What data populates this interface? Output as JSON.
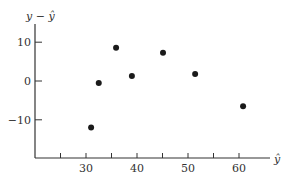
{
  "chart_data": {
    "type": "scatter",
    "title": "",
    "xlabel": "ŷ",
    "ylabel": "y − ŷ",
    "xlim": [
      20,
      66
    ],
    "ylim": [
      -20,
      14
    ],
    "x_ticks": [
      25,
      30,
      35,
      40,
      45,
      50,
      55,
      60
    ],
    "x_tick_labels": [
      "",
      "30",
      "",
      "40",
      "",
      "50",
      "",
      "60"
    ],
    "y_ticks": [
      10,
      0,
      -10
    ],
    "y_tick_labels": [
      "10",
      "0",
      "−10"
    ],
    "grid": false,
    "legend": null,
    "points": [
      {
        "x": 31.0,
        "y": -12.0
      },
      {
        "x": 32.5,
        "y": -0.5
      },
      {
        "x": 35.9,
        "y": 8.6
      },
      {
        "x": 39.0,
        "y": 1.3
      },
      {
        "x": 45.1,
        "y": 7.3
      },
      {
        "x": 51.4,
        "y": 1.8
      },
      {
        "x": 60.8,
        "y": -6.5
      }
    ],
    "colors": {
      "axis": "#333333",
      "point": "#1a1a1a"
    }
  }
}
